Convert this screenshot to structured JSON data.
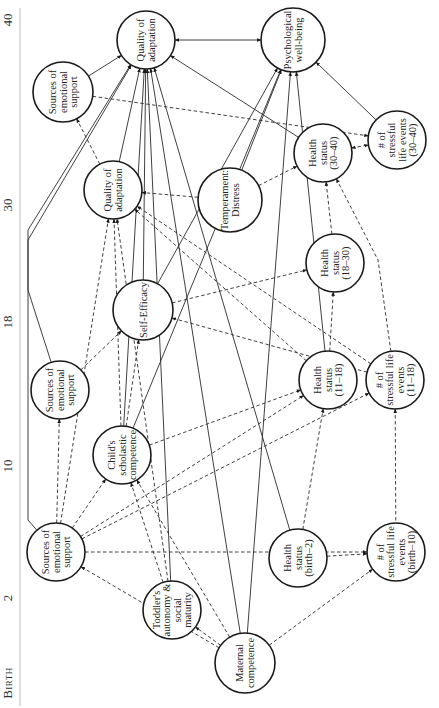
{
  "axis": {
    "orientation": "vertical-left, rotated labels",
    "ticks": [
      {
        "label": "40",
        "y": 20
      },
      {
        "label": "30",
        "y": 205
      },
      {
        "label": "18",
        "y": 322
      },
      {
        "label": "10",
        "y": 466
      },
      {
        "label": "2",
        "y": 598
      },
      {
        "label": "Birth",
        "y": 683
      }
    ]
  },
  "nodes": [
    {
      "id": "qa40",
      "lines": [
        "Quality of",
        "adaptation"
      ],
      "cx": 146,
      "cy": 40,
      "r": 29
    },
    {
      "id": "pwb",
      "lines": [
        "Psychological",
        "well-being"
      ],
      "cx": 293,
      "cy": 40,
      "r": 32
    },
    {
      "id": "ses30",
      "lines": [
        "Sources of",
        "emotional",
        "support"
      ],
      "cx": 63,
      "cy": 92,
      "r": 30
    },
    {
      "id": "qa30",
      "lines": [
        "Quality of",
        "adaptation"
      ],
      "cx": 113,
      "cy": 190,
      "r": 29
    },
    {
      "id": "temp",
      "lines": [
        "Temperament:",
        "Distress"
      ],
      "cx": 230,
      "cy": 200,
      "r": 32
    },
    {
      "id": "hs3040",
      "lines": [
        "Health",
        "status",
        "(30–40)"
      ],
      "cx": 323,
      "cy": 153,
      "r": 29
    },
    {
      "id": "sle3040",
      "lines": [
        "# of",
        "stressful",
        "life events",
        "(30–40)"
      ],
      "cx": 397,
      "cy": 140,
      "r": 29
    },
    {
      "id": "se",
      "lines": [
        "Self-Efficacy"
      ],
      "cx": 143,
      "cy": 310,
      "r": 30
    },
    {
      "id": "hs1830",
      "lines": [
        "Health",
        "status",
        "(18–30)"
      ],
      "cx": 335,
      "cy": 263,
      "r": 29
    },
    {
      "id": "ses18",
      "lines": [
        "Sources of",
        "emotional",
        "support"
      ],
      "cx": 60,
      "cy": 390,
      "r": 29
    },
    {
      "id": "csc",
      "lines": [
        "Child's",
        "scholastic",
        "competence"
      ],
      "cx": 122,
      "cy": 455,
      "r": 29
    },
    {
      "id": "hs1118",
      "lines": [
        "Health",
        "status",
        "(11–18)"
      ],
      "cx": 328,
      "cy": 380,
      "r": 29
    },
    {
      "id": "sle1118",
      "lines": [
        "# of",
        "stressful life",
        "events",
        "(11–18)"
      ],
      "cx": 395,
      "cy": 380,
      "r": 29
    },
    {
      "id": "ses2",
      "lines": [
        "Sources of",
        "emotional",
        "support"
      ],
      "cx": 56,
      "cy": 552,
      "r": 29
    },
    {
      "id": "hsb2",
      "lines": [
        "Health",
        "status",
        "(birth–2)"
      ],
      "cx": 298,
      "cy": 558,
      "r": 29
    },
    {
      "id": "sleb10",
      "lines": [
        "# of",
        "stressful life",
        "events",
        "(birth–10)"
      ],
      "cx": 396,
      "cy": 552,
      "r": 29
    },
    {
      "id": "tod",
      "lines": [
        "Toddler's",
        "autonomy &",
        "social",
        "maturity"
      ],
      "cx": 172,
      "cy": 610,
      "r": 29
    },
    {
      "id": "mc",
      "lines": [
        "Maternal",
        "competence"
      ],
      "cx": 245,
      "cy": 663,
      "r": 30
    }
  ],
  "edges": [
    {
      "from": "qa40",
      "to": "pwb",
      "style": "solid",
      "bidirectional": true
    },
    {
      "from": "ses30",
      "to": "qa40",
      "style": "solid"
    },
    {
      "from": "qa30",
      "to": "qa40",
      "style": "solid"
    },
    {
      "from": "ses18",
      "to": "qa40",
      "style": "solid",
      "via": [
        [
          28,
          290
        ],
        [
          28,
          240
        ]
      ]
    },
    {
      "from": "ses2",
      "to": "qa40",
      "style": "solid",
      "via": [
        [
          28,
          520
        ],
        [
          28,
          230
        ]
      ]
    },
    {
      "from": "csc",
      "to": "qa40",
      "style": "solid"
    },
    {
      "from": "se",
      "to": "qa40",
      "style": "solid"
    },
    {
      "from": "tod",
      "to": "qa40",
      "style": "solid"
    },
    {
      "from": "mc",
      "to": "qa40",
      "style": "solid"
    },
    {
      "from": "hsb2",
      "to": "qa40",
      "style": "solid"
    },
    {
      "from": "hs3040",
      "to": "qa40",
      "style": "solid"
    },
    {
      "from": "sle3040",
      "to": "pwb",
      "style": "solid"
    },
    {
      "from": "temp",
      "to": "pwb",
      "style": "solid"
    },
    {
      "from": "se",
      "to": "pwb",
      "style": "solid"
    },
    {
      "from": "mc",
      "to": "pwb",
      "style": "solid"
    },
    {
      "from": "hs1118",
      "to": "pwb",
      "style": "solid"
    },
    {
      "from": "csc",
      "to": "pwb",
      "style": "solid"
    },
    {
      "from": "qa30",
      "to": "ses30",
      "style": "dashed"
    },
    {
      "from": "ses30",
      "to": "sle3040",
      "style": "dashed"
    },
    {
      "from": "temp",
      "to": "hs3040",
      "style": "dashed"
    },
    {
      "from": "hs3040",
      "to": "sle3040",
      "style": "dashed",
      "bidirectional": true
    },
    {
      "from": "temp",
      "to": "qa30",
      "style": "dashed"
    },
    {
      "from": "hs1118",
      "to": "qa30",
      "style": "dashed"
    },
    {
      "from": "sle1118",
      "to": "qa30",
      "style": "dashed"
    },
    {
      "from": "ses2",
      "to": "qa30",
      "style": "dashed"
    },
    {
      "from": "csc",
      "to": "qa30",
      "style": "dashed"
    },
    {
      "from": "tod",
      "to": "qa30",
      "style": "dashed"
    },
    {
      "from": "se",
      "to": "hs1830",
      "style": "dashed"
    },
    {
      "from": "sle1118",
      "to": "se",
      "style": "dashed"
    },
    {
      "from": "ses18",
      "to": "se",
      "style": "dashed"
    },
    {
      "from": "csc",
      "to": "se",
      "style": "dashed"
    },
    {
      "from": "hs1830",
      "to": "hs3040",
      "style": "dashed"
    },
    {
      "from": "sle1118",
      "to": "hs3040",
      "style": "dashed",
      "via": [
        [
          378,
          260
        ]
      ]
    },
    {
      "from": "hs1118",
      "to": "hs1830",
      "style": "dashed"
    },
    {
      "from": "ses2",
      "to": "ses18",
      "style": "dashed"
    },
    {
      "from": "ses2",
      "to": "csc",
      "style": "dashed"
    },
    {
      "from": "tod",
      "to": "csc",
      "style": "dashed"
    },
    {
      "from": "mc",
      "to": "csc",
      "style": "dashed"
    },
    {
      "from": "csc",
      "to": "hs1118",
      "style": "dashed"
    },
    {
      "from": "ses2",
      "to": "hs1118",
      "style": "dashed"
    },
    {
      "from": "ses2",
      "to": "sle1118",
      "style": "dashed"
    },
    {
      "from": "hsb2",
      "to": "hs1118",
      "style": "dashed"
    },
    {
      "from": "sle1118",
      "to": "sleb10",
      "style": "dashed",
      "reverse_arrow": true
    },
    {
      "from": "ses2",
      "to": "sleb10",
      "style": "dashed"
    },
    {
      "from": "hsb2",
      "to": "sleb10",
      "style": "dashed"
    },
    {
      "from": "mc",
      "to": "sleb10",
      "style": "dashed"
    },
    {
      "from": "mc",
      "to": "tod",
      "style": "dashed"
    },
    {
      "from": "mc",
      "to": "ses2",
      "style": "dashed"
    }
  ]
}
